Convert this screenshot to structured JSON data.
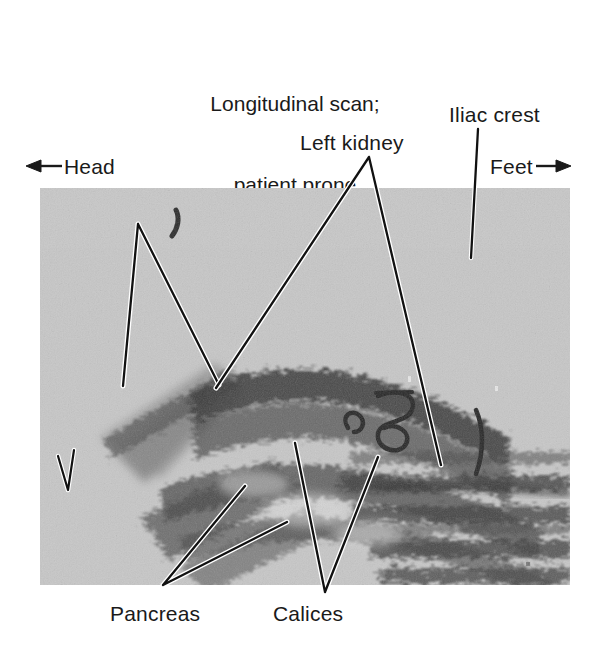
{
  "figure": {
    "type": "medical-ultrasound-annotated-figure",
    "modality": "B-mode ultrasonography",
    "caption_lines": [
      "Longitudinal scan;",
      "patient prone",
      "8 cm to left of spine"
    ],
    "orientation": {
      "left_label": "Head",
      "left_arrow": "left-arrow-icon",
      "right_label": "Feet",
      "right_arrow": "right-arrow-icon"
    },
    "scale_marker": {
      "label": "1 cm",
      "glyph": "caliper-bracket-icon"
    },
    "annotations": [
      {
        "id": "spleen",
        "label": "Spleen",
        "pointer": "v-bracket",
        "position": "upper-left"
      },
      {
        "id": "left-kidney",
        "label": "Left kidney",
        "pointer": "wide-inverted-v",
        "position": "top-center"
      },
      {
        "id": "iliac-crest",
        "label": "Iliac crest",
        "pointer": "straight-leader",
        "position": "top-right"
      },
      {
        "id": "pancreas",
        "label": "Pancreas",
        "pointer": "v-bracket",
        "position": "bottom-left"
      },
      {
        "id": "calices",
        "label": "Calices",
        "pointer": "v-bracket",
        "position": "bottom-center"
      }
    ],
    "colors": {
      "background": "#ffffff",
      "text": "#1a1a1a",
      "scan_base_gray": "#c9c9c9",
      "scan_dark": "#2e2e2e",
      "leader_dark": "#111111",
      "leader_light": "#ffffff"
    },
    "scan_frame": {
      "x": 40,
      "y": 188,
      "width": 530,
      "height": 397
    }
  }
}
